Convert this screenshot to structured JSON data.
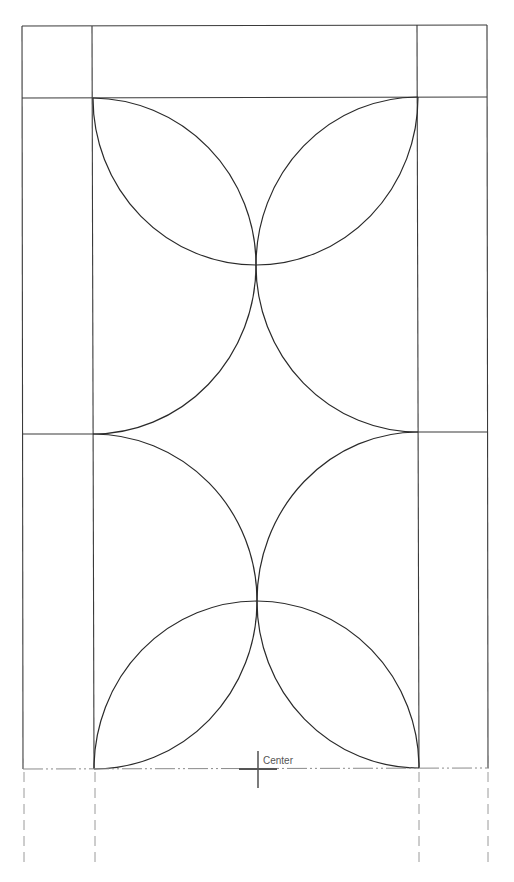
{
  "diagram": {
    "type": "quilt-block-template",
    "center_label": "Center",
    "colors": {
      "outline": "#3a3a3a",
      "arcs": "#2a2a2a",
      "centerline": "#8a8a8a",
      "extension_lines": "#9a9a9a"
    },
    "outer_frame": {
      "left": 22,
      "right": 487,
      "top": 26,
      "bottom": 769
    },
    "inner_columns": {
      "left": 93,
      "right": 418
    },
    "horizontal_rules": [
      98,
      433
    ],
    "arc_radius": 165,
    "arc_centers": [
      {
        "x": 93,
        "y": 265
      },
      {
        "x": 418,
        "y": 265
      },
      {
        "x": 256,
        "y": 98
      },
      {
        "x": 93,
        "y": 601
      },
      {
        "x": 418,
        "y": 601
      },
      {
        "x": 256,
        "y": 769
      }
    ],
    "intersections": [
      {
        "x": 256,
        "y": 265
      },
      {
        "x": 257,
        "y": 601
      }
    ],
    "center_mark": {
      "x": 258,
      "y": 769
    }
  }
}
